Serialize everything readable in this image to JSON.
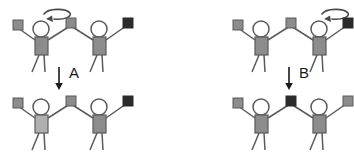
{
  "figure": {
    "type": "diagram",
    "background_color": "#ffffff",
    "stroke_color": "#4a4a4a",
    "label_color": "#1a1a1a",
    "colors": {
      "square_gray": "#8c8c8c",
      "square_black": "#2b2b2b",
      "torso_gray": "#8c8c8c",
      "torso_light_gray": "#b0b0b0",
      "outline": "#5a5a5a"
    }
  },
  "panels": [
    {
      "id": "top-left",
      "name": "panel-top-left",
      "position": "top-left",
      "state": "before",
      "rotation_arrow": {
        "present": true,
        "over_actor": "left",
        "direction": "counterclockwise",
        "name": "rotate-swap-arrow"
      },
      "actors": [
        {
          "name": "actor-left",
          "torso_color": "#8c8c8c"
        },
        {
          "name": "actor-right",
          "torso_color": "#8c8c8c"
        }
      ],
      "squares": [
        {
          "slot": "left-outer",
          "color": "#8c8c8c",
          "shade": "gray"
        },
        {
          "slot": "center",
          "color": "#8c8c8c",
          "shade": "gray"
        },
        {
          "slot": "right-outer",
          "color": "#2b2b2b",
          "shade": "black"
        }
      ]
    },
    {
      "id": "bottom-left",
      "name": "panel-bottom-left",
      "position": "bottom-left",
      "state": "after",
      "rotation_arrow": {
        "present": false
      },
      "actors": [
        {
          "name": "actor-left",
          "torso_color": "#b0b0b0"
        },
        {
          "name": "actor-right",
          "torso_color": "#8c8c8c"
        }
      ],
      "squares": [
        {
          "slot": "left-outer",
          "color": "#8c8c8c",
          "shade": "gray"
        },
        {
          "slot": "center",
          "color": "#8c8c8c",
          "shade": "gray"
        },
        {
          "slot": "right-outer",
          "color": "#2b2b2b",
          "shade": "black"
        }
      ]
    },
    {
      "id": "top-right",
      "name": "panel-top-right",
      "position": "top-right",
      "state": "before",
      "rotation_arrow": {
        "present": true,
        "over_actor": "right",
        "direction": "counterclockwise",
        "name": "rotate-swap-arrow"
      },
      "actors": [
        {
          "name": "actor-left",
          "torso_color": "#8c8c8c"
        },
        {
          "name": "actor-right",
          "torso_color": "#8c8c8c"
        }
      ],
      "squares": [
        {
          "slot": "left-outer",
          "color": "#8c8c8c",
          "shade": "gray"
        },
        {
          "slot": "center",
          "color": "#8c8c8c",
          "shade": "gray"
        },
        {
          "slot": "right-outer",
          "color": "#2b2b2b",
          "shade": "black"
        }
      ]
    },
    {
      "id": "bottom-right",
      "name": "panel-bottom-right",
      "position": "bottom-right",
      "state": "after",
      "rotation_arrow": {
        "present": false
      },
      "actors": [
        {
          "name": "actor-left",
          "torso_color": "#8c8c8c"
        },
        {
          "name": "actor-right",
          "torso_color": "#8c8c8c"
        }
      ],
      "squares": [
        {
          "slot": "left-outer",
          "color": "#8c8c8c",
          "shade": "gray"
        },
        {
          "slot": "center",
          "color": "#2b2b2b",
          "shade": "black"
        },
        {
          "slot": "right-outer",
          "color": "#8c8c8c",
          "shade": "gray"
        }
      ]
    }
  ],
  "transitions": [
    {
      "id": "A",
      "name": "transition-a",
      "label": "A",
      "from_panel": "top-left",
      "to_panel": "bottom-left",
      "arrow_direction": "down"
    },
    {
      "id": "B",
      "name": "transition-b",
      "label": "B",
      "from_panel": "top-right",
      "to_panel": "bottom-right",
      "arrow_direction": "down"
    }
  ]
}
